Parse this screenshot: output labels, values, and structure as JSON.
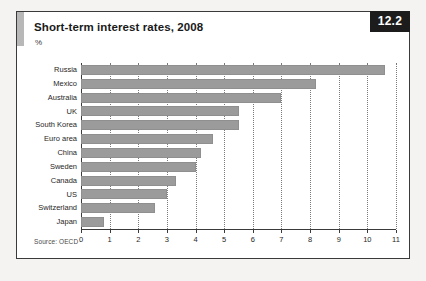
{
  "figure": {
    "title": "Short-term interest rates, 2008",
    "unit_label": "%",
    "badge": "12.2",
    "source": "Source: OECD"
  },
  "colors": {
    "bar": "#9b9b9b",
    "badge_background": "#1c1c1c",
    "badge_text": "#ffffff",
    "frame": "#3a3a3a",
    "accent_block": "#b8b8b8"
  },
  "chart_data": {
    "type": "bar",
    "orientation": "horizontal",
    "title": "Short-term interest rates, 2008",
    "xlabel": "%",
    "ylabel": "",
    "xlim": [
      0,
      11
    ],
    "xticks": [
      0,
      1,
      2,
      3,
      4,
      5,
      6,
      7,
      8,
      9,
      10,
      11
    ],
    "xtick_labels": [
      "0",
      "1",
      "2",
      "3",
      "4",
      "5",
      "6",
      "7",
      "8",
      "9",
      "10",
      "11"
    ],
    "grid": true,
    "grid_style": "dotted-vertical",
    "legend": false,
    "categories": [
      "Russia",
      "Mexico",
      "Australia",
      "UK",
      "South Korea",
      "Euro area",
      "China",
      "Sweden",
      "Canada",
      "US",
      "Switzerland",
      "Japan"
    ],
    "values": [
      10.6,
      8.2,
      7.0,
      5.5,
      5.5,
      4.6,
      4.2,
      4.0,
      3.3,
      3.0,
      2.6,
      0.8
    ]
  }
}
